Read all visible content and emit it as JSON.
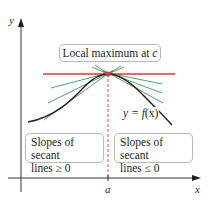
{
  "figure": {
    "axes": {
      "y_label": "y",
      "x_label": "x",
      "x_tick_label": "a"
    },
    "callouts": {
      "local_max": {
        "text": "Local maximum at ",
        "var": "c"
      },
      "left_slopes": {
        "line1": "Slopes of secant",
        "line2": "lines ≥ 0"
      },
      "right_slopes": {
        "line1": "Slopes of secant",
        "line2": "lines ≤ 0"
      }
    },
    "curve_label": {
      "prefix": "y = ",
      "func": "f",
      "arg": "(x)"
    },
    "colors": {
      "axis": "#231f20",
      "curve": "#231f20",
      "tangent": "#e8303a",
      "secant": "#3c9a5a",
      "guide": "#e8303a",
      "box_border": "#b9b9b9"
    }
  }
}
